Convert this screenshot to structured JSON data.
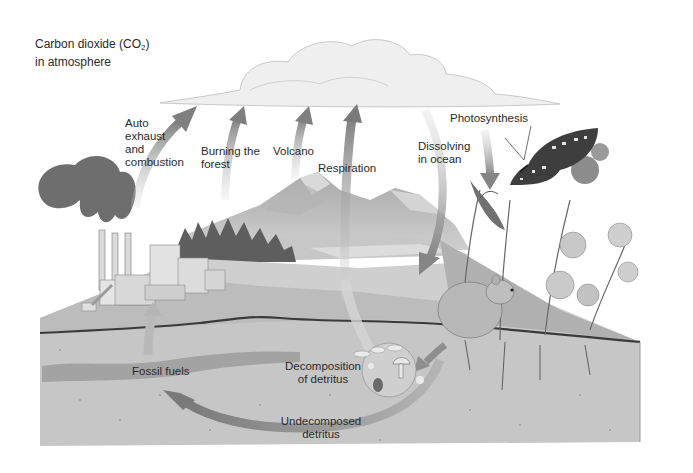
{
  "diagram": {
    "type": "carbon-cycle-illustration",
    "title": {
      "line1_prefix": "Carbon dioxide (CO",
      "line1_subscript": "2",
      "line1_suffix": ")",
      "line2": "in atmosphere"
    },
    "labels": {
      "auto_exhaust": [
        "Auto",
        "exhaust",
        "and",
        "combustion"
      ],
      "burning_forest": [
        "Burning the",
        "forest"
      ],
      "volcano": "Volcano",
      "respiration": "Respiration",
      "dissolving_ocean": [
        "Dissolving",
        "in ocean"
      ],
      "photosynthesis": "Photosynthesis",
      "fossil_fuels": "Fossil fuels",
      "decomposition": [
        "Decomposition",
        "of detritus"
      ],
      "undecomposed": [
        "Undecomposed",
        "detritus"
      ]
    },
    "flows": [
      {
        "from": "factory / auto exhaust",
        "to": "atmosphere",
        "direction": "up"
      },
      {
        "from": "forest burning",
        "to": "atmosphere",
        "direction": "up"
      },
      {
        "from": "volcano",
        "to": "atmosphere",
        "direction": "up"
      },
      {
        "from": "organisms (respiration)",
        "to": "atmosphere",
        "direction": "up"
      },
      {
        "from": "atmosphere",
        "to": "ocean",
        "direction": "down"
      },
      {
        "from": "atmosphere",
        "to": "plants (photosynthesis)",
        "direction": "down"
      },
      {
        "from": "detritus",
        "to": "decomposers",
        "direction": "down"
      },
      {
        "from": "undecomposed detritus",
        "to": "fossil fuels",
        "direction": "left"
      },
      {
        "from": "fossil fuels",
        "to": "factory",
        "direction": "up"
      }
    ],
    "colors": {
      "background": "#ffffff",
      "arrow": "#8a8a8a",
      "arrow_light": "#c4c4c4",
      "soil": "#c9c9c9",
      "fossil_layer": "#a9a9a9",
      "cloud": "#efefef",
      "text": "#2a2a2a"
    }
  }
}
